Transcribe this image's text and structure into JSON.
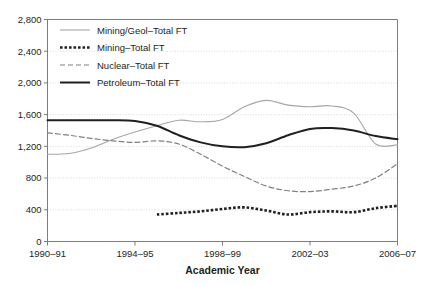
{
  "chart_data": {
    "type": "line",
    "title": "",
    "xlabel": "Academic Year",
    "ylabel": "",
    "ylim": [
      0,
      2800
    ],
    "ytick_step": 400,
    "yticks": [
      "0",
      "400",
      "800",
      "1,200",
      "1,600",
      "2,000",
      "2,400",
      "2,800"
    ],
    "grid": true,
    "legend_position": "top-left inside plot area",
    "x": [
      "1990-91",
      "1991-92",
      "1992-93",
      "1993-94",
      "1994-95",
      "1995-96",
      "1996-97",
      "1997-98",
      "1998-99",
      "1999-00",
      "2000-01",
      "2001-02",
      "2002-03",
      "2003-04",
      "2004-05",
      "2005-06",
      "2006-07"
    ],
    "xtick_labels": [
      "1990–91",
      "1994–95",
      "1998–99",
      "2002–03",
      "2006–07"
    ],
    "xtick_indices": [
      0,
      4,
      8,
      12,
      16
    ],
    "series": [
      {
        "name": "Mining/Geol–Total FT",
        "style": "solid-light",
        "color": "#a6a6a6",
        "values": [
          1100,
          1110,
          1180,
          1290,
          1380,
          1460,
          1530,
          1510,
          1540,
          1700,
          1780,
          1720,
          1700,
          1710,
          1620,
          1230,
          1220
        ]
      },
      {
        "name": "Mining–Total FT",
        "style": "dotted-bold",
        "color": "#231f20",
        "values": [
          null,
          null,
          null,
          null,
          null,
          340,
          360,
          380,
          410,
          430,
          390,
          340,
          370,
          380,
          370,
          420,
          450
        ]
      },
      {
        "name": "Nuclear–Total FT",
        "style": "dashed",
        "color": "#808080",
        "values": [
          1370,
          1340,
          1300,
          1270,
          1250,
          1270,
          1230,
          1100,
          950,
          820,
          700,
          640,
          630,
          660,
          700,
          800,
          980
        ]
      },
      {
        "name": "Petroleum–Total FT",
        "style": "solid-bold",
        "color": "#231f20",
        "values": [
          1530,
          1530,
          1530,
          1530,
          1520,
          1460,
          1340,
          1250,
          1200,
          1190,
          1240,
          1340,
          1420,
          1430,
          1400,
          1330,
          1290
        ]
      }
    ]
  },
  "legend": {
    "entries": [
      {
        "label": "Mining/Geol–Total FT"
      },
      {
        "label": "Mining–Total FT"
      },
      {
        "label": "Nuclear–Total FT"
      },
      {
        "label": "Petroleum–Total FT"
      }
    ]
  },
  "axes": {
    "x_title": "Academic Year"
  }
}
